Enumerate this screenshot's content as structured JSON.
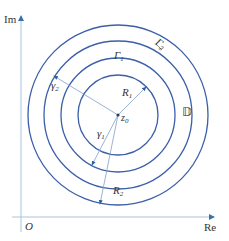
{
  "diagram": {
    "axes": {
      "x_label": "Re",
      "y_label": "Im",
      "origin_label": "O",
      "axis_color": "#8aaed2"
    },
    "center": {
      "label": "z",
      "sub": "0",
      "x": 118,
      "y": 115
    },
    "circles": {
      "color": "#3b5fa8",
      "radii": [
        40,
        57,
        74,
        90
      ]
    },
    "labels": {
      "gamma_big_1": {
        "main": "Γ",
        "sub": "1"
      },
      "gamma_big_2": {
        "main": "Γ",
        "sub": "2"
      },
      "domain": "𝔻",
      "R1": {
        "main": "R",
        "sub": "1"
      },
      "R2": {
        "main": "R",
        "sub": "2"
      },
      "gamma_small_1": {
        "main": "γ",
        "sub": "1"
      },
      "gamma_small_2": {
        "main": "γ",
        "sub": "2"
      }
    }
  }
}
